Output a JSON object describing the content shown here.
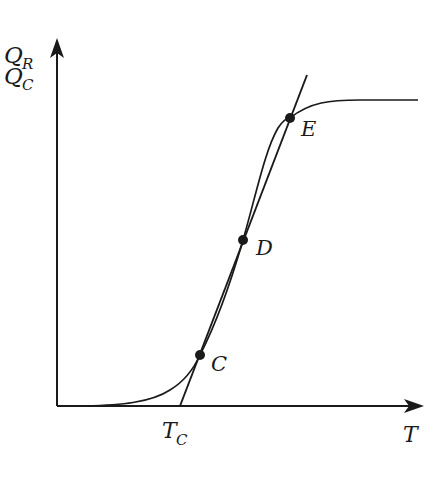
{
  "diagram": {
    "y_axis": {
      "label_top": {
        "main": "Q",
        "sub": "R"
      },
      "label_bottom": {
        "main": "Q",
        "sub": "C"
      }
    },
    "x_axis": {
      "label": "T",
      "tick_label": {
        "main": "T",
        "sub": "C"
      }
    },
    "points": [
      {
        "id": "C",
        "label": "C"
      },
      {
        "id": "D",
        "label": "D"
      },
      {
        "id": "E",
        "label": "E"
      }
    ],
    "curves": {
      "sigmoid": "Q_R (heat generation, S-shaped)",
      "line": "Q_C (heat removal, straight line from T_C)"
    },
    "colors": {
      "ink": "#1a1a1a",
      "background": "#ffffff"
    }
  }
}
